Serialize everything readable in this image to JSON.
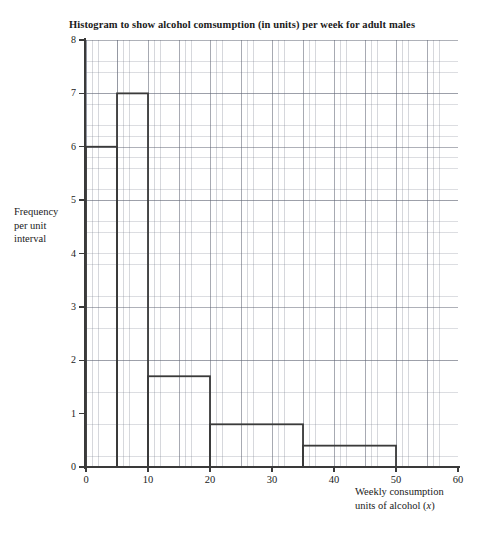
{
  "chart_data": {
    "type": "bar",
    "title": "Histogram to show alcohol comsumption (in units) per week for adult males",
    "xlabel_line1": "Weekly consumption",
    "xlabel_line2_pre": "units of alcohol (",
    "xlabel_line2_var": "x",
    "xlabel_line2_post": ")",
    "ylabel_line1": "Frequency",
    "ylabel_line2": "per unit",
    "ylabel_line3": "interval",
    "xlim": [
      0,
      60
    ],
    "ylim": [
      0,
      8
    ],
    "x_axis_max_drawn": 60,
    "grid": true,
    "grid_style": "graph-paper",
    "legend": "none",
    "x_ticks": [
      0,
      10,
      20,
      30,
      40,
      50,
      60
    ],
    "y_ticks": [
      0,
      1,
      2,
      3,
      4,
      5,
      6,
      7,
      8
    ],
    "bin_edges": [
      0,
      5,
      10,
      20,
      35,
      50
    ],
    "values": [
      6,
      7,
      1.7,
      0.8,
      0.4
    ],
    "bars": [
      {
        "label": "0-5",
        "x_start": 0,
        "x_end": 5,
        "height": 6
      },
      {
        "label": "5-10",
        "x_start": 5,
        "x_end": 10,
        "height": 7
      },
      {
        "label": "10-20",
        "x_start": 10,
        "x_end": 20,
        "height": 1.7
      },
      {
        "label": "20-35",
        "x_start": 20,
        "x_end": 35,
        "height": 0.8
      },
      {
        "label": "35-50",
        "x_start": 35,
        "x_end": 50,
        "height": 0.4
      }
    ],
    "colors": {
      "bar_stroke": "#3a3a3a",
      "bar_fill": "none",
      "axis": "#3a3a3a",
      "grid_minor": "#787d8c",
      "grid_major": "#5f6473",
      "text": "#1a1a1a",
      "background": "#ffffff"
    }
  }
}
